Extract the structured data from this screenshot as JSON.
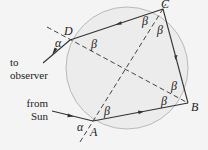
{
  "diagram": {
    "type": "rainbow-raindrop-ray-diagram",
    "colors": {
      "background": "#f4f4f4",
      "drop_fill": "#ececec",
      "drop_outline": "#b9b9b9",
      "ray": "#333333",
      "normal": "#444444"
    },
    "vertices": {
      "A": "A",
      "B": "B",
      "C": "C",
      "D": "D"
    },
    "angles": {
      "alpha_at_D": "α",
      "alpha_at_A": "α",
      "beta_at_D": "β",
      "beta_at_A": "β",
      "beta_C_left": "β",
      "beta_C_right": "β",
      "beta_B_upper": "β",
      "beta_B_lower": "β"
    },
    "labels": {
      "to_observer_line1": "to",
      "to_observer_line2": "observer",
      "from_sun_line1": "from",
      "from_sun_line2": "Sun"
    }
  }
}
